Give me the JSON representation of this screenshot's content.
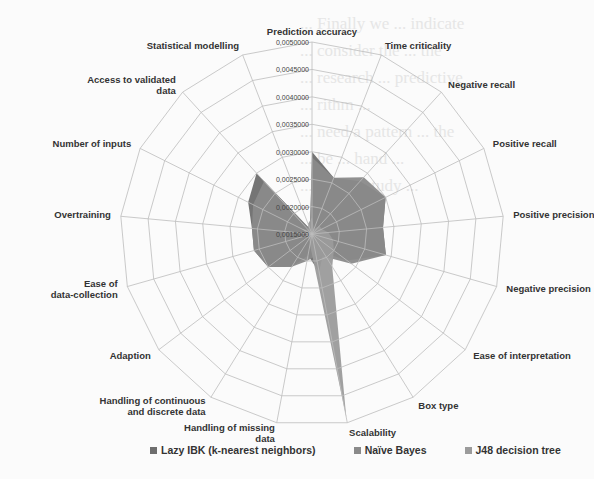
{
  "background_text": [
    "... Finally we ... indicate",
    "... consider the ... the",
    "... research ... predictive",
    "... rithm ...",
    "... need a pattern ... the",
    "... be ... hand ...",
    "... ysis ... study ..."
  ],
  "chart_data": {
    "type": "radar",
    "title": "",
    "center": [
      312,
      234
    ],
    "radius": 192,
    "rmin": 0.0015,
    "rmax": 0.005,
    "ticks": [
      "0,0015000",
      "0,0020000",
      "0,0025000",
      "0,0030000",
      "0,0035000",
      "0,0040000",
      "0,0045000",
      "0,0050000"
    ],
    "tick_values": [
      0.0015,
      0.002,
      0.0025,
      0.003,
      0.0035,
      0.004,
      0.0045,
      0.005
    ],
    "categories": [
      "Prediction accuracy",
      "Time criticality",
      "Negative recall",
      "Positive recall",
      "Positive precision",
      "Negative precision",
      "Ease of interpretation",
      "Box type",
      "Scalability",
      "Handling of missing data",
      "Handling of continuous and discrete data",
      "Adaption",
      "Ease of data-collection",
      "Overtraining",
      "Number of inputs",
      "Access to validated data",
      "Statistical modelling"
    ],
    "series": [
      {
        "name": "Lazy IBK (k-nearest neighbors)",
        "color": "#6e6e6e",
        "values": [
          0.003,
          0.0026,
          0.0028,
          0.003,
          0.0028,
          0.0029,
          0.0023,
          0.0019,
          0.0022,
          0.0019,
          0.0022,
          0.0025,
          0.0026,
          0.0026,
          0.0028,
          0.003,
          0.0016
        ]
      },
      {
        "name": "Naïve Bayes",
        "color": "#8a8a8a",
        "values": [
          0.0029,
          0.0026,
          0.0029,
          0.003,
          0.0028,
          0.0029,
          0.0024,
          0.002,
          0.0019,
          0.002,
          0.0022,
          0.0025,
          0.0026,
          0.0026,
          0.0027,
          0.0028,
          0.0016
        ]
      },
      {
        "name": "J48 decision tree",
        "color": "#9b9b9b",
        "values": [
          0.0018,
          0.0016,
          0.0017,
          0.0017,
          0.0018,
          0.0019,
          0.002,
          0.0022,
          0.0049,
          0.0017,
          0.0016,
          0.0016,
          0.0016,
          0.0016,
          0.0017,
          0.0016,
          0.0017
        ]
      }
    ],
    "legend_position": "bottom",
    "grid": true
  },
  "legend": [
    {
      "label": "Lazy IBK (k-nearest neighbors)",
      "color": "#6e6e6e"
    },
    {
      "label": "Naïve Bayes",
      "color": "#8a8a8a"
    },
    {
      "label": "J48 decision tree",
      "color": "#9b9b9b"
    }
  ]
}
